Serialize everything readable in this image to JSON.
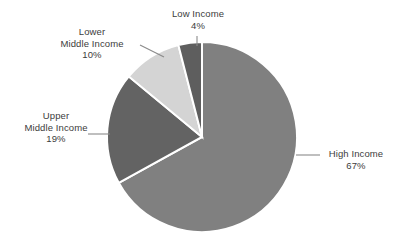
{
  "chart_data": {
    "type": "pie",
    "title": "",
    "subtitle": "",
    "xlabel": "",
    "ylabel": "",
    "legend_position": "none",
    "grid": false,
    "labels_outside": true,
    "categories": [
      "High Income",
      "Upper Middle Income",
      "Lower Middle Income",
      "Low Income"
    ],
    "values": [
      67,
      19,
      10,
      4
    ],
    "value_unit": "%",
    "slices": [
      {
        "name": "High Income",
        "value": 67,
        "value_label": "67%",
        "color": "#808080",
        "start_angle_deg": 0,
        "end_angle_deg": 241.2
      },
      {
        "name": "Upper Middle Income",
        "value": 19,
        "value_label": "19%",
        "color": "#636363",
        "start_angle_deg": 241.2,
        "end_angle_deg": 309.6
      },
      {
        "name": "Lower Middle Income",
        "value": 10,
        "value_label": "10%",
        "color": "#d4d4d4",
        "start_angle_deg": 309.6,
        "end_angle_deg": 345.6
      },
      {
        "name": "Low Income",
        "value": 4,
        "value_label": "4%",
        "color": "#5e5e5e",
        "start_angle_deg": 345.6,
        "end_angle_deg": 360
      }
    ],
    "colors": {
      "high_income": "#808080",
      "upper_middle_income": "#636363",
      "lower_middle_income": "#d4d4d4",
      "low_income": "#5e5e5e",
      "slice_border": "#ffffff",
      "leader_line": "#808080",
      "text": "#3c3c3c",
      "background": "#ffffff"
    }
  },
  "labels": {
    "low_income": {
      "line1": "Low Income",
      "pct": "4%"
    },
    "lower_middle_income": {
      "line1": "Lower",
      "line2": "Middle Income",
      "pct": "10%"
    },
    "upper_middle_income": {
      "line1": "Upper",
      "line2": "Middle Income",
      "pct": "19%"
    },
    "high_income": {
      "line1": "High Income",
      "pct": "67%"
    }
  }
}
